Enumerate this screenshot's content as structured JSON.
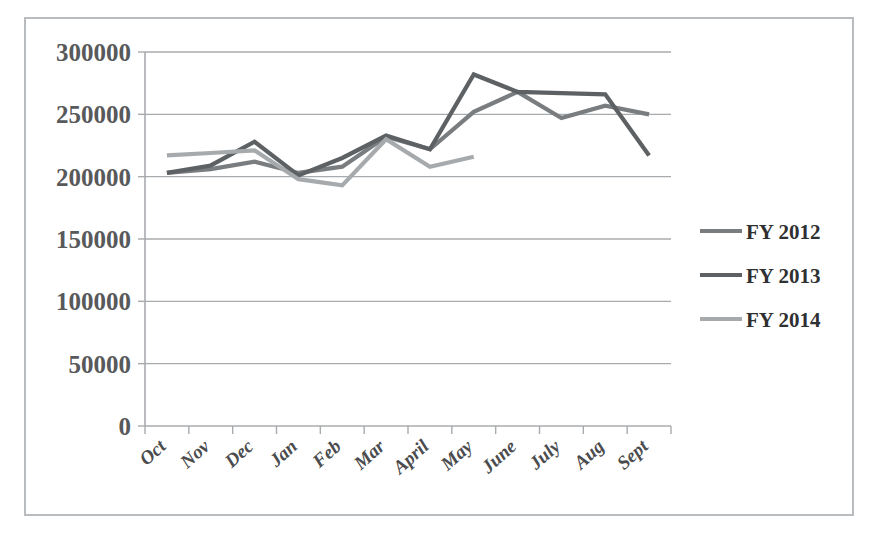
{
  "chart_data": {
    "type": "line",
    "title": "",
    "xlabel": "",
    "ylabel": "",
    "categories": [
      "Oct",
      "Nov",
      "Dec",
      "Jan",
      "Feb",
      "Mar",
      "April",
      "May",
      "June",
      "July",
      "Aug",
      "Sept"
    ],
    "ylim": [
      0,
      300000
    ],
    "ytick_labels": [
      "300000",
      "250000",
      "200000",
      "150000",
      "100000",
      "50000",
      "0"
    ],
    "ytick_values": [
      300000,
      250000,
      200000,
      150000,
      100000,
      50000,
      0
    ],
    "grid": true,
    "legend_position": "right",
    "series": [
      {
        "name": "FY 2012",
        "color": "#7a7d80",
        "values": [
          203000,
          206000,
          212000,
          203000,
          208000,
          232000,
          222000,
          252000,
          268000,
          247000,
          257000,
          250000
        ]
      },
      {
        "name": "FY 2013",
        "color": "#5e6164",
        "values": [
          203000,
          209000,
          228000,
          201000,
          215000,
          233000,
          222000,
          282000,
          268000,
          267000,
          266000,
          217000
        ]
      },
      {
        "name": "FY 2014",
        "color": "#a7aaad",
        "values": [
          217000,
          219000,
          221000,
          198000,
          193000,
          230000,
          208000,
          216000,
          null,
          null,
          null,
          null
        ]
      }
    ]
  },
  "legend": {
    "items": [
      {
        "label": "FY 2012",
        "color": "#7a7d80"
      },
      {
        "label": "FY 2013",
        "color": "#5e6164"
      },
      {
        "label": "FY 2014",
        "color": "#a7aaad"
      }
    ]
  },
  "caption": {
    "text": ""
  },
  "colors": {
    "frame_border": "#b9bcbe",
    "grid": "#a8abae",
    "axis_text": "#58595b",
    "background": "#ffffff"
  }
}
